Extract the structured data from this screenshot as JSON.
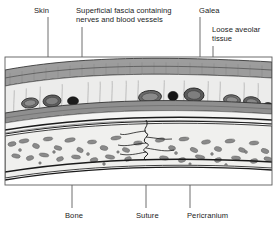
{
  "figure": {
    "background_color": "#ffffff",
    "frame": {
      "x": 5,
      "y": 57,
      "width": 267,
      "height": 128,
      "border_color": "#555555"
    }
  },
  "labels": [
    {
      "id": "skin",
      "text": "Skin",
      "x": 34,
      "y": 6,
      "leader": {
        "x1": 48,
        "y1": 17,
        "x2": 48,
        "y2": 74
      },
      "target_layer": "skin"
    },
    {
      "id": "superficial-fascia",
      "text": "Superficial fascia containing\nnerves and blood vessels",
      "x": 76,
      "y": 6,
      "leader": {
        "x1": 82,
        "y1": 27,
        "x2": 82,
        "y2": 97
      },
      "target_layer": "superficial-fascia"
    },
    {
      "id": "galea",
      "text": "Galea",
      "x": 199,
      "y": 6,
      "leader": {
        "x1": 200,
        "y1": 17,
        "x2": 200,
        "y2": 107
      },
      "target_layer": "galea"
    },
    {
      "id": "loose-aveolar-tissue",
      "text": "Loose aveolar\ntissue",
      "x": 212,
      "y": 25,
      "leader": {
        "x1": 213,
        "y1": 46,
        "x2": 213,
        "y2": 117
      },
      "target_layer": "loose-aveolar-tissue"
    },
    {
      "id": "bone",
      "text": "Bone",
      "x": 65,
      "y": 211,
      "leader": {
        "x1": 72,
        "y1": 155,
        "x2": 72,
        "y2": 208
      },
      "target_layer": "bone"
    },
    {
      "id": "suture",
      "text": "Suture",
      "x": 136,
      "y": 211,
      "leader": {
        "x1": 146,
        "y1": 152,
        "x2": 146,
        "y2": 208
      },
      "target_layer": "suture"
    },
    {
      "id": "pericranium",
      "text": "Pericranium",
      "x": 187,
      "y": 211,
      "leader": {
        "x1": 190,
        "y1": 125,
        "x2": 190,
        "y2": 208
      },
      "target_layer": "pericranium"
    }
  ],
  "layers": [
    {
      "id": "skin",
      "name": "Skin",
      "color": "#a8a8a8",
      "order": 1
    },
    {
      "id": "superficial-fascia",
      "name": "Superficial fascia containing nerves and blood vessels",
      "color": "#e8e8e6",
      "order": 2
    },
    {
      "id": "galea",
      "name": "Galea",
      "color": "#9a9a9a",
      "order": 3
    },
    {
      "id": "loose-aveolar-tissue",
      "name": "Loose aveolar tissue",
      "color": "#f2f2f0",
      "order": 4
    },
    {
      "id": "pericranium",
      "name": "Pericranium",
      "color": "#2b2b2b",
      "order": 5
    },
    {
      "id": "bone",
      "name": "Bone",
      "color": "#efefed",
      "order": 6
    },
    {
      "id": "suture",
      "name": "Suture",
      "color": "#ffffff",
      "order": 7
    }
  ],
  "vessels": [
    {
      "cx": 30,
      "cy": 103,
      "rx": 8.5,
      "ry": 5.0,
      "rot": -8,
      "fill": "#6e6e6e",
      "type": "vessel-oval"
    },
    {
      "cx": 52,
      "cy": 101,
      "rx": 9.0,
      "ry": 6.0,
      "rot": -5,
      "fill": "#5e5e5e",
      "type": "vessel-oval"
    },
    {
      "cx": 73,
      "cy": 101,
      "rx": 5.5,
      "ry": 4.2,
      "rot": 0,
      "fill": "#1c1c1c",
      "type": "vessel-dark"
    },
    {
      "cx": 150,
      "cy": 97,
      "rx": 11.5,
      "ry": 6.5,
      "rot": -4,
      "fill": "#6a6a6a",
      "type": "vessel-oval"
    },
    {
      "cx": 173,
      "cy": 96,
      "rx": 5.0,
      "ry": 4.6,
      "rot": 0,
      "fill": "#151515",
      "type": "vessel-dark"
    },
    {
      "cx": 194,
      "cy": 95,
      "rx": 10.0,
      "ry": 7.0,
      "rot": 3,
      "fill": "#5a5a5a",
      "type": "vessel-oval"
    },
    {
      "cx": 232,
      "cy": 100,
      "rx": 8.5,
      "ry": 5.2,
      "rot": 6,
      "fill": "#707070",
      "type": "vessel-oval"
    },
    {
      "cx": 252,
      "cy": 102,
      "rx": 8.5,
      "ry": 5.2,
      "rot": 9,
      "fill": "#646464",
      "type": "vessel-oval"
    },
    {
      "cx": 268,
      "cy": 106,
      "rx": 4.5,
      "ry": 3.4,
      "rot": 12,
      "fill": "#141414",
      "type": "vessel-dark"
    }
  ]
}
